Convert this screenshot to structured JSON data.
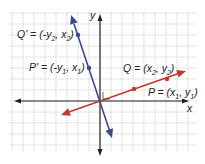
{
  "axes": {
    "x_label": "x",
    "y_label": "y"
  },
  "points": [
    {
      "id": "Q_prime",
      "name": "Q'",
      "coords": "(-y2, x2)",
      "text_main": "Q' = (-y",
      "sub1": "2",
      "text_mid": ", x",
      "sub2": "2",
      "text_end": ")"
    },
    {
      "id": "P_prime",
      "name": "P'",
      "coords": "(-y1, x1)",
      "text_main": "P' = (-y",
      "sub1": "1",
      "text_mid": ", x",
      "sub2": "1",
      "text_end": ")"
    },
    {
      "id": "Q",
      "name": "Q",
      "coords": "(x2, y2)",
      "text_main": "Q = (x",
      "sub1": "2",
      "text_mid": ", y",
      "sub2": "2",
      "text_end": ")"
    },
    {
      "id": "P",
      "name": "P",
      "coords": "(x1, y1)",
      "text_main": "P = (x",
      "sub1": "1",
      "text_mid": ", y",
      "sub2": "1",
      "text_end": ")"
    }
  ],
  "colors": {
    "rotated_line": "#3a4a8c",
    "original_line": "#c0392b",
    "grid": "#c8c8c8",
    "axis": "#222222"
  },
  "annotation": "right-angle marker at origin"
}
